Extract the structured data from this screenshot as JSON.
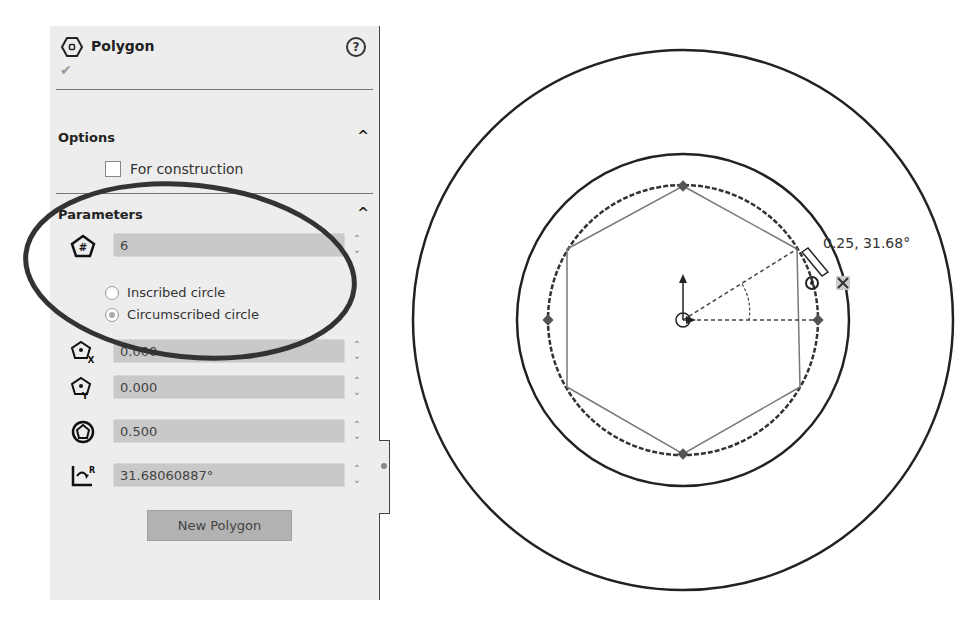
{
  "panel": {
    "title": "Polygon",
    "help_icon": "?",
    "ok_icon": "✔",
    "options": {
      "title": "Options",
      "collapse_icon": "^",
      "for_construction_label": "For construction",
      "for_construction_checked": false
    },
    "parameters": {
      "title": "Parameters",
      "collapse_icon": "^",
      "sides": "6",
      "radio_inscribed": "Inscribed circle",
      "radio_circumscribed": "Circumscribed circle",
      "selected": "Circumscribed circle",
      "center_x": "0.000",
      "center_y": "0.000",
      "diameter": "0.500",
      "angle": "31.68060887°",
      "spinner": "⌃⌄"
    },
    "new_polygon_label": "New Polygon"
  },
  "canvas": {
    "cursor_readout": "0.25, 31.68°"
  }
}
